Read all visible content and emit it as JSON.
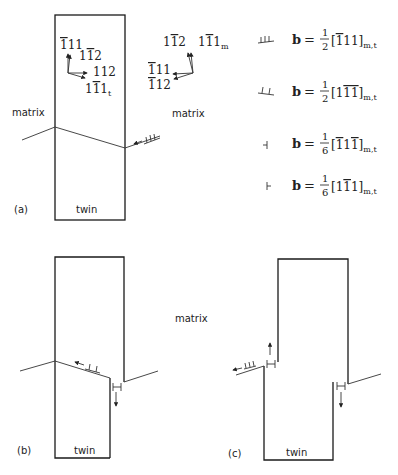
{
  "panels": {
    "a": {
      "label": "(a)",
      "matrix_label": "matrix",
      "twin_label": "twin",
      "twin_directions": {
        "d1": {
          "base": "111",
          "bars": "1",
          "text": "111",
          "display": "̄111"
        },
        "d2": "1̄12",
        "d3": "112",
        "d4": "1̄1̄1",
        "d4_sub": "t"
      },
      "matrix_directions": {
        "d1": "1̄12",
        "d2": "1̄1̄1",
        "d2_sub": "m",
        "d3": "̄111",
        "d4": "̄112"
      },
      "matrix_label_right": "matrix"
    },
    "b": {
      "label": "(b)",
      "twin_label": "twin"
    },
    "c": {
      "label": "(c)",
      "twin_label": "twin"
    },
    "center_matrix_label": "matrix"
  },
  "legend": [
    {
      "symbol": "triple-dislocation-icon",
      "prefix": "b = ",
      "num": "1",
      "den": "2",
      "vector": "[̄111]",
      "sub": "m,t"
    },
    {
      "symbol": "double-dislocation-icon",
      "prefix": "b = ",
      "num": "1",
      "den": "2",
      "vector": "[11̄1̄]",
      "sub": "m,t"
    },
    {
      "symbol": "partial-dislocation-left-icon",
      "prefix": "b = ",
      "num": "1",
      "den": "6",
      "vector": "[̄11̄1]",
      "sub": "m,t"
    },
    {
      "symbol": "partial-dislocation-right-icon",
      "prefix": "b = ",
      "num": "1",
      "den": "6",
      "vector": "[1̄11]",
      "sub": "m,t"
    }
  ]
}
